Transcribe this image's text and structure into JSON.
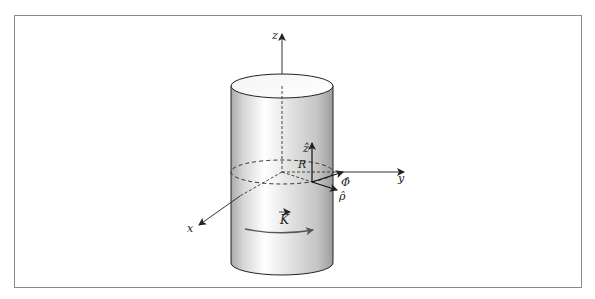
{
  "figure": {
    "axes": {
      "x_label": "x",
      "y_label": "y",
      "z_label": "z"
    },
    "unit_vectors": {
      "z_hat": "ẑ",
      "phi_hat": "Φ̂",
      "rho_hat": "ρ̂"
    },
    "radius_label": "R",
    "current_label": "K",
    "colors": {
      "frame": "#8a8a8a",
      "stroke": "#222222",
      "axis": "#333333",
      "cylinder_dark": "#a8a8a8",
      "cylinder_light": "#ffffff",
      "current_arrow": "#555555"
    }
  }
}
